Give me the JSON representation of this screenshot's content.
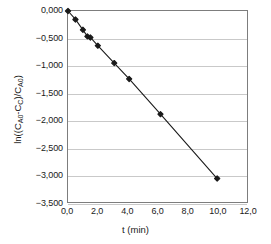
{
  "chart_data": {
    "type": "scatter",
    "title": "",
    "subtitle": "",
    "xlabel": "t (min)",
    "ylabel": "ln((C_A0-C_C)/C_A0)",
    "ylabel_html": "ln((C<sub>A0</sub>-C<sub>C</sub>)/C<sub>A0</sub>)",
    "xlim": [
      0,
      12
    ],
    "ylim": [
      -3.5,
      0
    ],
    "grid": "horizontal",
    "legend": "none",
    "marker": "filled-diamond",
    "line_style": "solid",
    "line_color": "#1a1a1a",
    "marker_color": "#1a1a1a",
    "decimal_separator": "comma",
    "x_ticks": [
      0,
      2,
      4,
      6,
      8,
      10,
      12
    ],
    "x_tick_labels": [
      "0,0",
      "2,0",
      "4,0",
      "6,0",
      "8,0",
      "10,0",
      "12,0"
    ],
    "y_ticks": [
      0,
      -0.5,
      -1,
      -1.5,
      -2,
      -2.5,
      -3,
      -3.5
    ],
    "y_tick_labels": [
      "0,000",
      "-0,500",
      "-1,000",
      "-1,500",
      "-2,000",
      "-2,500",
      "-3,000",
      "-3,500"
    ],
    "x": [
      0.0,
      0.5,
      1.0,
      1.3,
      1.5,
      2.0,
      3.1,
      4.1,
      6.2,
      10.0
    ],
    "y": [
      0.0,
      -0.155,
      -0.345,
      -0.465,
      -0.485,
      -0.635,
      -0.955,
      -1.245,
      -1.89,
      -3.07
    ],
    "points": [
      {
        "t": 0.0,
        "value": 0.0
      },
      {
        "t": 0.5,
        "value": -0.155
      },
      {
        "t": 1.0,
        "value": -0.345
      },
      {
        "t": 1.3,
        "value": -0.465
      },
      {
        "t": 1.5,
        "value": -0.485
      },
      {
        "t": 2.0,
        "value": -0.635
      },
      {
        "t": 3.1,
        "value": -0.955
      },
      {
        "t": 4.1,
        "value": -1.245
      },
      {
        "t": 6.2,
        "value": -1.89
      },
      {
        "t": 10.0,
        "value": -3.07
      }
    ]
  },
  "colors": {
    "plot_border": "#7d7d7d",
    "gridline": "#c9c9c9",
    "data": "#1a1a1a",
    "background": "#ffffff",
    "text": "#1a1a1a"
  }
}
